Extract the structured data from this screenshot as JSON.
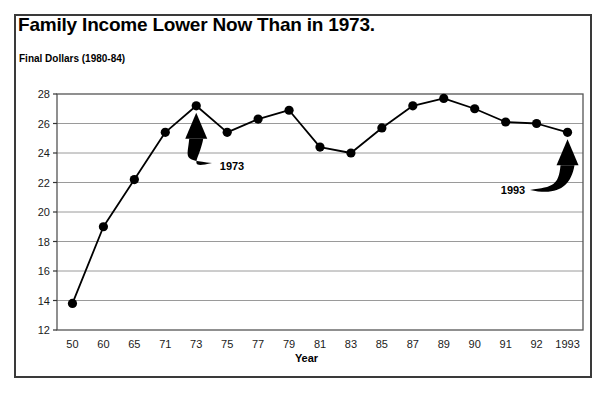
{
  "chart_data": {
    "type": "line",
    "title": "Family Income Lower Now Than in 1973.",
    "subtitle": "Final Dollars (1980-84)",
    "xlabel": "Year",
    "ylabel": "",
    "ylim": [
      12,
      28
    ],
    "ytick_labels": [
      "28",
      "26",
      "24",
      "22",
      "20",
      "18",
      "16",
      "14",
      "12"
    ],
    "ytick_values": [
      28,
      26,
      24,
      22,
      20,
      18,
      16,
      14,
      12
    ],
    "grid": true,
    "legend": null,
    "categories": [
      "50",
      "60",
      "65",
      "71",
      "73",
      "75",
      "77",
      "79",
      "81",
      "83",
      "85",
      "87",
      "89",
      "90",
      "91",
      "92",
      "1993"
    ],
    "values": [
      13.8,
      19.0,
      22.2,
      25.4,
      27.2,
      25.4,
      26.3,
      26.9,
      24.4,
      24.0,
      25.7,
      27.2,
      27.7,
      27.0,
      26.1,
      26.0,
      25.4
    ],
    "annotations": [
      {
        "label": "1973",
        "points_to_category": "73",
        "label_x": 232,
        "label_y": 166
      },
      {
        "label": "1993",
        "points_to_category": "1993",
        "label_x": 513,
        "label_y": 190
      }
    ],
    "marker": "filled-circle",
    "line_color": "#000000",
    "grid_color": "#9a9a9a",
    "frame_color": "#3a3a3a"
  }
}
